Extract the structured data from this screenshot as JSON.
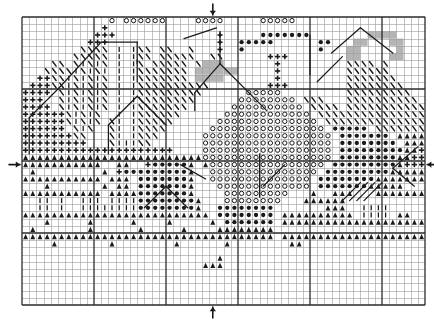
{
  "document": {
    "type": "cross-stitch-pattern-chart",
    "title": "Cross Stitch Pattern Chart",
    "background_color": "#ffffff",
    "ink_color": "#1a1a1a",
    "grid_line_color": "#9a9a9a",
    "bold_line_color": "#2b2b2b",
    "shade_color": "#b4b4b4"
  },
  "grid": {
    "origin_x": 22,
    "origin_y": 17,
    "cell_size": 7.2,
    "columns": 56,
    "rows": 40,
    "bold_every": 10,
    "thin_line_width": 0.6,
    "bold_line_width": 1.3
  },
  "center_markers": [
    {
      "name": "top-center-arrow",
      "glyph": "down-arrow",
      "col": 26,
      "edge": "top"
    },
    {
      "name": "bottom-center-arrow",
      "glyph": "up-arrow",
      "col": 26,
      "edge": "bottom"
    },
    {
      "name": "left-center-arrow",
      "glyph": "right-arrow",
      "row": 20,
      "edge": "left"
    },
    {
      "name": "right-center-arrow",
      "glyph": "left-arrow",
      "row": 20,
      "edge": "right"
    }
  ],
  "symbol_legend": [
    {
      "key": "o",
      "name": "open-circle",
      "description": "ring outline"
    },
    {
      "key": "d",
      "name": "filled-circle",
      "description": "solid dot"
    },
    {
      "key": "p",
      "name": "plus-cross",
      "description": "bold cross"
    },
    {
      "key": "t",
      "name": "triangle-a",
      "description": "filled triangle / A"
    },
    {
      "key": "v",
      "name": "vertical-bar",
      "description": "upright stroke"
    },
    {
      "key": "b",
      "name": "backslash",
      "description": "diagonal stroke"
    },
    {
      "key": "g",
      "name": "gray-square",
      "description": "shaded cell"
    },
    {
      "key": "x",
      "name": "circle-in-box",
      "description": "ring on shaded cell"
    }
  ],
  "chart_data": {
    "type": "heatmap",
    "title": "Cross Stitch Pattern Chart",
    "xlabel": "",
    "ylabel": "",
    "columns": 56,
    "rows": 40,
    "legend": [
      "open-circle",
      "filled-circle",
      "plus-cross",
      "triangle-a",
      "vertical-bar",
      "backslash",
      "gray-square"
    ],
    "cells": [
      "............o.oooooo....oooo.....ooooo..................",
      "...........p............................................",
      "..........ppp..............p.....ddddddd........gggg.....",
      ".........ppp...............p..ddddd......dd...gg...gg....",
      "........bbbb.v.vbb.bb..b...p..d..........d...gg.....g....",
      ".......bbbbb.v.vbb.bbbbb..bb......ppp........gg....gg....",
      "....bb.bvbvb.v.vb.bbbbb.bggg.......p.........bbbb.b......",
      "...bbbbvbvbv.v.vbbbbbbb.gggggg.....p.........bbbbbb......",
      "..ppbbvbvbvb.v.vbbbbbbb.gggg.......p.........bbbbbbb.....",
      ".pppbbvbvbvb.v.vbbbbbbbbbb........ppp........bbbbbbbb....",
      "pppp.bvbvbvb.v.vbbbbbbbbb......ooooo.........bbbbbbbbb...",
      "ppp..bvbvbvb.v.vbbbbbbbb......oooooooo.bbb...bbbbbbbbbb..",
      "pppp.bvbvbvb.v.vbbbbbbb......oooooooooo.bbbb.bbbbbbbbbbb.",
      "ppppppbvbvb..v.vbbbbbb......oooooooooooo.bbbbbbbbbbbbbbbb",
      "ppppppbvbvb.bv.vbbbbb......oooooooooooooo.bbbbbbbbbbbbbbb",
      "pppppp.bvb..bv.vbbbb......oooooooooooooooo.ddddd.bbbbbbbb",
      "pppppppbb...bv.vbbb......oooooooooooooooooo.ddddddd.ttttt",
      "ppppppppp...bvvvbb.......oooooooooooooooooo.dddddddd.tttt",
      "ppppppppppppppppppppp....oooooooooooooooooo.dddddddddttpp",
      "tttttttttttttttttttttttttoooooooooooooooooo.ddddddddttppp",
      "ttttttttttt..tt..pdddddt.toooooooooooooooo.dddddddddtpppp",
      ".t.........t.pdddddddddt..ooooooooooooooo.dddddddddtttttt",
      "ttttttttttt.ttt.dddddddt..oooooooooooooo.ddddddddttttttt.",
      "...t.......t.tt.dddddddt...ooooooooooooo.dddddddttttt....",
      "ttttttttttt.ttttdddddddt....ooooooooo...t..ttt...tttttttt",
      "..vv.v..vvv.vvvvddddddddt...oooooooo...tttttt............",
      "..vv.v..vvvvvvvvddddddddt..dddddddd.......ttt..vvvv......",
      "tttttttttttttttttttttttttt.dddddddd.tttttttttt.vvvv.tt...",
      "...t.....t.....t....t.....t.ddddddd.ttttttttttttttttttttt",
      ".t.......t......t.....t....tttttttt.....................t",
      "ttttttttttttttttttttttttttttttttttt.tttttttttttttttttttt.",
      "....t.......t........t......t........tt..................",
      ".........................................................",
      "...........................t.............................",
      ".........................ttt.............................",
      ".........................................................",
      ".........................................................",
      ".........................................................",
      ".........................................................",
      "........................................................."
    ],
    "backstitch_lines": [
      {
        "name": "left-roof-diagonal",
        "points": [
          [
            11.0,
            3.5
          ],
          [
            5.0,
            10.0
          ]
        ]
      },
      {
        "name": "left-roof-base",
        "points": [
          [
            5.0,
            10.0
          ],
          [
            1.0,
            14.0
          ]
        ]
      },
      {
        "name": "left-house-left-wall",
        "points": [
          [
            1.0,
            14.0
          ],
          [
            1.0,
            19.0
          ]
        ]
      },
      {
        "name": "upper-ridge-run",
        "points": [
          [
            11.0,
            3.5
          ],
          [
            16.0,
            3.5
          ]
        ]
      },
      {
        "name": "upper-ridge-drop",
        "points": [
          [
            16.0,
            3.5
          ],
          [
            16.0,
            6.5
          ]
        ]
      },
      {
        "name": "upper-right-slope",
        "points": [
          [
            22.5,
            3.0
          ],
          [
            27.0,
            1.5
          ]
        ]
      },
      {
        "name": "right-peak-up",
        "points": [
          [
            27.5,
            2.0
          ],
          [
            27.5,
            6.5
          ]
        ]
      },
      {
        "name": "center-peak-left",
        "points": [
          [
            27.5,
            6.5
          ],
          [
            24.0,
            10.5
          ]
        ]
      },
      {
        "name": "center-peak-right",
        "points": [
          [
            27.5,
            6.5
          ],
          [
            31.5,
            10.5
          ]
        ]
      },
      {
        "name": "center-skirt-left",
        "points": [
          [
            24.0,
            10.5
          ],
          [
            24.0,
            13.0
          ]
        ]
      },
      {
        "name": "center-skirt-right",
        "points": [
          [
            31.5,
            10.5
          ],
          [
            34.0,
            13.0
          ]
        ]
      },
      {
        "name": "mid-left-gable-left",
        "points": [
          [
            12.0,
            15.0
          ],
          [
            16.0,
            11.0
          ]
        ]
      },
      {
        "name": "mid-left-gable-right",
        "points": [
          [
            16.0,
            11.0
          ],
          [
            20.0,
            15.0
          ]
        ]
      },
      {
        "name": "mid-left-gable-foot",
        "points": [
          [
            12.0,
            15.0
          ],
          [
            12.0,
            19.0
          ]
        ]
      },
      {
        "name": "small-peak-left",
        "points": [
          [
            17.0,
            26.5
          ],
          [
            20.0,
            23.5
          ]
        ]
      },
      {
        "name": "small-peak-right",
        "points": [
          [
            20.0,
            23.5
          ],
          [
            23.0,
            26.5
          ]
        ]
      },
      {
        "name": "right-gable-left",
        "points": [
          [
            43.0,
            5.0
          ],
          [
            47.0,
            1.5
          ]
        ]
      },
      {
        "name": "right-gable-right",
        "points": [
          [
            47.0,
            1.5
          ],
          [
            51.5,
            5.0
          ]
        ]
      },
      {
        "name": "right-valley",
        "points": [
          [
            41.0,
            9.0
          ],
          [
            44.5,
            5.5
          ]
        ]
      },
      {
        "name": "far-right-hook-a",
        "points": [
          [
            55.0,
            18.0
          ],
          [
            51.5,
            21.0
          ]
        ]
      },
      {
        "name": "far-right-hook-b",
        "points": [
          [
            51.5,
            21.0
          ],
          [
            54.5,
            23.5
          ]
        ]
      },
      {
        "name": "lower-left-tail",
        "points": [
          [
            22.0,
            20.5
          ],
          [
            25.5,
            22.5
          ]
        ]
      },
      {
        "name": "lower-center-tail",
        "points": [
          [
            33.5,
            23.5
          ],
          [
            36.5,
            20.5
          ]
        ]
      },
      {
        "name": "lower-right-rake-1",
        "points": [
          [
            44.5,
            25.5
          ],
          [
            47.0,
            23.0
          ]
        ]
      },
      {
        "name": "lower-right-rake-2",
        "points": [
          [
            45.5,
            25.5
          ],
          [
            48.0,
            23.0
          ]
        ]
      },
      {
        "name": "lower-right-rake-3",
        "points": [
          [
            46.5,
            25.5
          ],
          [
            49.0,
            23.0
          ]
        ]
      },
      {
        "name": "lower-right-rake-4",
        "points": [
          [
            47.5,
            25.5
          ],
          [
            50.0,
            23.0
          ]
        ]
      },
      {
        "name": "tall-vertical-right",
        "points": [
          [
            40.0,
            2.5
          ],
          [
            40.0,
            8.0
          ]
        ]
      },
      {
        "name": "tall-vertical-center",
        "points": [
          [
            33.0,
            19.0
          ],
          [
            33.0,
            25.0
          ]
        ]
      },
      {
        "name": "short-vertical-left",
        "points": [
          [
            16.0,
            6.0
          ],
          [
            16.0,
            9.0
          ]
        ]
      }
    ]
  }
}
